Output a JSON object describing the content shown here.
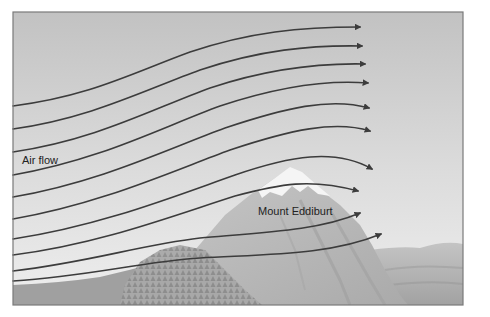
{
  "figure": {
    "labels": {
      "air_flow": "Air flow",
      "mountain": "Mount Eddiburt"
    },
    "colors": {
      "sky_top": "#c4c4c4",
      "sky_bottom": "#ececec",
      "frame": "#7a7a7a",
      "flow_line": "#3c3c3c",
      "mountain": "#b9b9b9",
      "mountain_shadow": "#a4a4a4",
      "snow": "#f7f7f7",
      "forest": "#999999",
      "hills": "#b2b2b2",
      "foreground": "#9c9c9c"
    },
    "flow_lines": [
      {
        "id": 1,
        "start_y": 106,
        "end": [
          360,
          27
        ]
      },
      {
        "id": 2,
        "start_y": 129,
        "end": [
          362,
          46
        ]
      },
      {
        "id": 3,
        "start_y": 152,
        "end": [
          365,
          64
        ]
      },
      {
        "id": 4,
        "start_y": 175,
        "end": [
          368,
          83
        ]
      },
      {
        "id": 5,
        "start_y": 197,
        "end": [
          369,
          108
        ]
      },
      {
        "id": 6,
        "start_y": 219,
        "end": [
          370,
          131
        ]
      },
      {
        "id": 7,
        "start_y": 239,
        "end": [
          372,
          169
        ]
      },
      {
        "id": 8,
        "start_y": 255,
        "end": [
          358,
          191
        ]
      },
      {
        "id": 9,
        "start_y": 271,
        "end": [
          360,
          213
        ]
      },
      {
        "id": 10,
        "start_y": 281,
        "end": [
          381,
          234
        ]
      }
    ]
  }
}
